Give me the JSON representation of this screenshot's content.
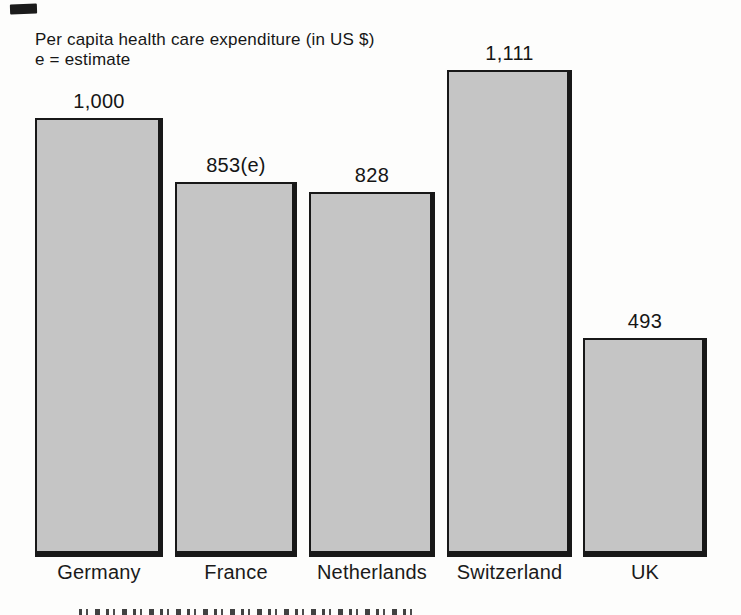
{
  "title": {
    "line1": "Per capita health care expenditure (in US $)",
    "line2": "e = estimate"
  },
  "chart_data": {
    "type": "bar",
    "title": "Per capita health care expenditure (in US $)",
    "note": "e = estimate",
    "categories": [
      "Germany",
      "France",
      "Netherlands",
      "Switzerland",
      "UK"
    ],
    "values": [
      1000,
      853,
      828,
      1111,
      493
    ],
    "value_labels": [
      "1,000",
      "853(e)",
      "828",
      "1,111",
      "493"
    ],
    "estimate_flags": [
      false,
      true,
      false,
      false,
      false
    ],
    "xlabel": "",
    "ylabel": "",
    "ylim": [
      0,
      1150
    ],
    "grid": false,
    "axes_shown": false,
    "value_labels_shown": true,
    "legend": null,
    "bar_color": "#c5c5c5",
    "bar_border_color": "#181818",
    "background_color": "#fdfdfc"
  }
}
